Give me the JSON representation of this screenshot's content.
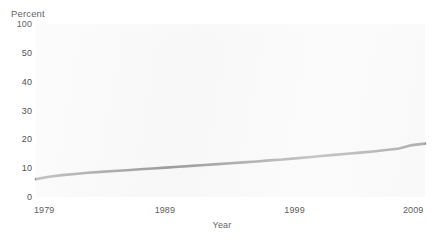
{
  "chart_data": {
    "type": "line",
    "title": "",
    "xlabel": "Year",
    "ylabel": "Percent",
    "grid": false,
    "legend": false,
    "xlim": [
      1979,
      2009
    ],
    "ylim": [
      0,
      100
    ],
    "ytick_labels": [
      "100",
      "50",
      "40",
      "30",
      "20",
      "10",
      "0"
    ],
    "xtick_labels": [
      "1979",
      "1989",
      "1999",
      "2009"
    ],
    "line_color": "#8c8c8c",
    "panel_color": "#f7f7f7",
    "series": [
      {
        "name": "Percent",
        "x": [
          1979,
          1980,
          1981,
          1982,
          1983,
          1984,
          1985,
          1986,
          1987,
          1988,
          1989,
          1990,
          1991,
          1992,
          1993,
          1994,
          1995,
          1996,
          1997,
          1998,
          1999,
          2000,
          2001,
          2002,
          2003,
          2004,
          2005,
          2006,
          2007,
          2008,
          2009
        ],
        "values": [
          6.2,
          7.0,
          7.6,
          8.0,
          8.4,
          8.7,
          9.0,
          9.3,
          9.6,
          9.9,
          10.2,
          10.5,
          10.8,
          11.1,
          11.4,
          11.7,
          12.0,
          12.3,
          12.7,
          13.0,
          13.4,
          13.8,
          14.2,
          14.6,
          15.0,
          15.4,
          15.8,
          16.3,
          16.8,
          18.0,
          18.5
        ]
      }
    ]
  },
  "axes": {
    "y_title": "Percent",
    "x_title": "Year",
    "y_ticks": [
      {
        "label": "100",
        "value": 100
      },
      {
        "label": "50",
        "value": 83.33
      },
      {
        "label": "40",
        "value": 66.67
      },
      {
        "label": "30",
        "value": 50
      },
      {
        "label": "20",
        "value": 33.33
      },
      {
        "label": "10",
        "value": 16.67
      },
      {
        "label": "0",
        "value": 0
      }
    ],
    "x_ticks": [
      {
        "label": "1979",
        "value": 1979
      },
      {
        "label": "1989",
        "value": 1989
      },
      {
        "label": "1999",
        "value": 1999
      },
      {
        "label": "2009",
        "value": 2009
      }
    ]
  }
}
